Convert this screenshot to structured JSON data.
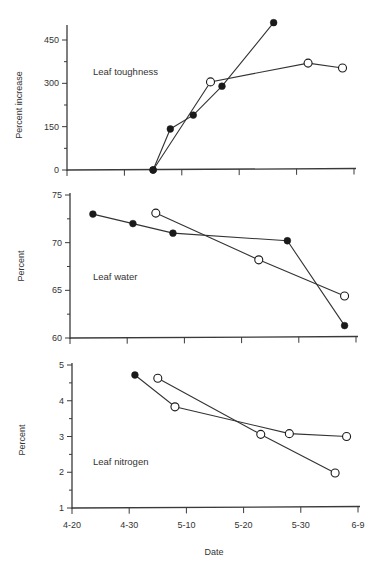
{
  "chart_data": [
    {
      "type": "line",
      "panel_label": "Leaf toughness",
      "xlabel": "",
      "ylabel": "Percent increase",
      "x_unit": "days after 4-20",
      "xlim": [
        0,
        50
      ],
      "ylim": [
        0,
        450
      ],
      "yticks": [
        0,
        150,
        300,
        450
      ],
      "yminor": [
        75,
        225,
        375
      ],
      "xtick_labels": [],
      "series": [
        {
          "name": "filled",
          "x": [
            15,
            18,
            22,
            27,
            36
          ],
          "y": [
            0,
            142,
            190,
            290,
            510
          ],
          "markers": [
            "filled",
            "filled",
            "filled",
            "filled",
            "filled"
          ]
        },
        {
          "name": "open",
          "x": [
            15,
            25,
            42,
            48
          ],
          "y": [
            0,
            305,
            370,
            353
          ],
          "markers": [
            "filled",
            "open",
            "open",
            "open"
          ]
        }
      ]
    },
    {
      "type": "line",
      "panel_label": "Leaf water",
      "xlabel": "",
      "ylabel": "Percent",
      "x_unit": "days after 4-20",
      "xlim": [
        0,
        50
      ],
      "ylim": [
        60,
        75
      ],
      "yticks": [
        60,
        65,
        70,
        75
      ],
      "yminor": [
        62.5,
        67.5,
        72.5
      ],
      "xtick_labels": [],
      "series": [
        {
          "name": "filled",
          "x": [
            4,
            11,
            18,
            38,
            48
          ],
          "y": [
            73.0,
            72.0,
            71.0,
            70.2,
            61.3
          ],
          "markers": [
            "filled",
            "filled",
            "filled",
            "filled",
            "filled"
          ]
        },
        {
          "name": "open",
          "x": [
            15,
            33,
            48
          ],
          "y": [
            73.1,
            68.2,
            64.4
          ],
          "markers": [
            "open",
            "open",
            "open"
          ]
        }
      ]
    },
    {
      "type": "line",
      "panel_label": "Leaf nitrogen",
      "xlabel": "Date",
      "ylabel": "Percent",
      "x_unit": "days after 4-20",
      "xlim": [
        0,
        50
      ],
      "ylim": [
        1,
        5
      ],
      "yticks": [
        1,
        2,
        3,
        4,
        5
      ],
      "yminor": [
        1.5,
        2.5,
        3.5,
        4.5
      ],
      "xtick_labels": [
        "4-20",
        "4-30",
        "5-10",
        "5-20",
        "5-30",
        "6-9"
      ],
      "series": [
        {
          "name": "filled-start",
          "x": [
            11,
            18,
            38,
            48
          ],
          "y": [
            4.72,
            3.83,
            3.08,
            3.0
          ],
          "markers": [
            "filled",
            "open",
            "open",
            "open"
          ]
        },
        {
          "name": "open",
          "x": [
            15,
            33,
            46
          ],
          "y": [
            4.63,
            3.06,
            1.98
          ],
          "markers": [
            "open",
            "open",
            "open"
          ]
        }
      ]
    }
  ]
}
